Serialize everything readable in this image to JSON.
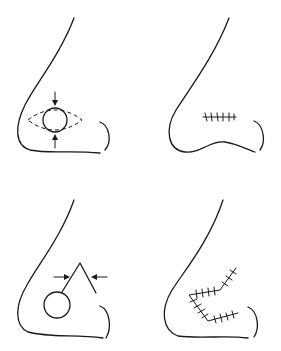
{
  "diagram": {
    "type": "medical-illustration",
    "panels": [
      {
        "id": "top-left",
        "content": "circular lesion with dashed elliptical excision outline and opposing compression arrows (vertical)"
      },
      {
        "id": "top-right",
        "content": "linear sutured closure on nasal ala"
      },
      {
        "id": "bottom-left",
        "content": "circular lesion with V-shaped flap and opposing arrows (horizontal)"
      },
      {
        "id": "bottom-right",
        "content": "Z-shaped sutured flap closure"
      }
    ],
    "colors": {
      "line": "#1a1a1a",
      "background": "#ffffff"
    }
  }
}
